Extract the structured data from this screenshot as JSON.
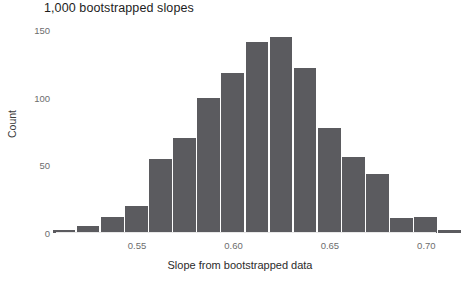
{
  "chart": {
    "title": "1,000 bootstrapped slopes",
    "xlabel": "Slope from bootstrapped data",
    "ylabel": "Count",
    "y_ticks": [
      "150",
      "100",
      "50",
      "0"
    ],
    "x_ticks": [
      "0.55",
      "0.60",
      "0.65",
      "0.70"
    ],
    "bar_color": "#5b5b5f",
    "background_color": "#ffffff"
  },
  "chart_data": {
    "type": "bar",
    "title": "1,000 bootstrapped slopes",
    "xlabel": "Slope from bootstrapped data",
    "ylabel": "Count",
    "xlim": [
      0.508,
      0.705
    ],
    "ylim": [
      0,
      156
    ],
    "grid": false,
    "legend": null,
    "bin_width": 0.0125,
    "categories": [
      "0.5125",
      "0.5250",
      "0.5375",
      "0.5500",
      "0.5625",
      "0.5750",
      "0.5875",
      "0.6000",
      "0.6125",
      "0.6250",
      "0.6375",
      "0.6500",
      "0.6625",
      "0.6750",
      "0.6875",
      "0.7000",
      "0.7125"
    ],
    "bin_edges": [
      0.50625,
      0.51875,
      0.53125,
      0.54375,
      0.55625,
      0.56875,
      0.58125,
      0.59375,
      0.60625,
      0.61875,
      0.63125,
      0.64375,
      0.65625,
      0.66875,
      0.68125,
      0.69375,
      0.70625,
      0.71875
    ],
    "values": [
      2,
      5,
      12,
      20,
      55,
      70,
      100,
      118,
      141,
      145,
      122,
      78,
      56,
      44,
      11,
      12,
      2
    ],
    "x_tick_values": [
      0.55,
      0.6,
      0.65,
      0.7
    ],
    "y_tick_values": [
      0,
      50,
      100,
      150
    ],
    "total_count": 1000
  }
}
